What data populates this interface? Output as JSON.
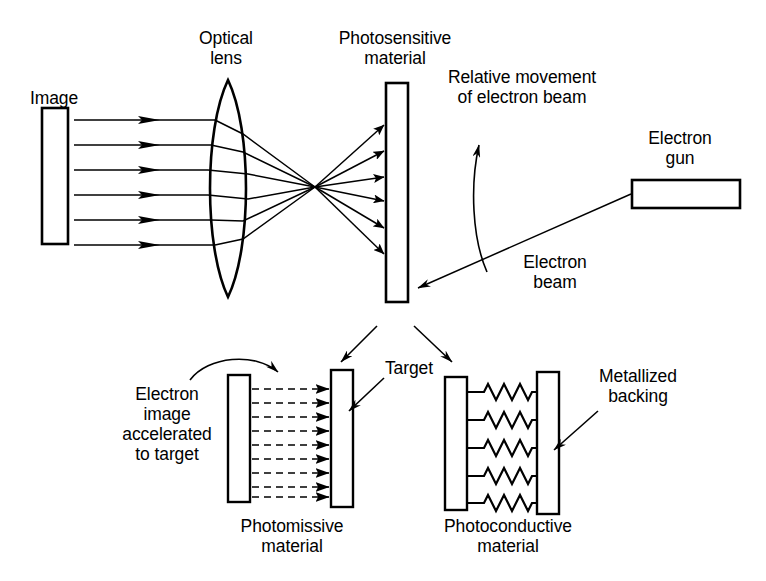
{
  "figure": {
    "background_color": "#ffffff",
    "ink_color": "#000000"
  },
  "labels": {
    "image": "Image",
    "optical_lens": "Optical\nlens",
    "photosensitive_material": "Photosensitive\nmaterial",
    "relative_movement": "Relative movement\nof electron beam",
    "electron_gun": "Electron\ngun",
    "electron_beam": "Electron\nbeam",
    "electron_image_accelerated": "Electron\nimage\naccelerated\nto target",
    "target": "Target",
    "photomissive_material": "Photomissive\nmaterial",
    "metallized_backing": "Metallized\nbacking",
    "photoconductive_material": "Photoconductive\nmaterial"
  },
  "components": {
    "image_plate": {
      "name": "image-plate",
      "shape": "rectangle"
    },
    "lens": {
      "name": "biconvex-lens",
      "shape": "lens"
    },
    "photosensitive_plate": {
      "name": "photosensitive-plate",
      "shape": "rectangle"
    },
    "electron_gun_box": {
      "name": "electron-gun-box",
      "shape": "rectangle"
    },
    "photomissive_plate": {
      "name": "photomissive-plate",
      "shape": "rectangle"
    },
    "target_plate": {
      "name": "target-plate",
      "shape": "rectangle"
    },
    "photoconductive_plate": {
      "name": "photoconductive-plate",
      "shape": "rectangle"
    },
    "metallized_backing_plate": {
      "name": "metallized-backing-plate",
      "shape": "rectangle"
    }
  },
  "counts": {
    "incoming_light_rays": 6,
    "converging_rays": 6,
    "dashed_electron_arrows": 9,
    "resistor_elements": 5
  }
}
